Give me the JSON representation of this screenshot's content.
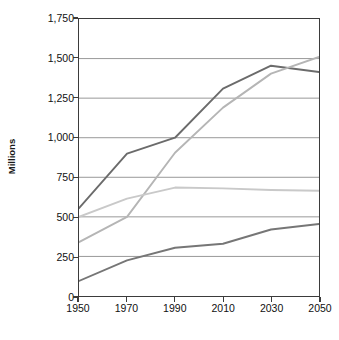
{
  "chart": {
    "title": "",
    "y_axis_title": "Millions",
    "x_axis_title": ""
  },
  "chart_data": {
    "type": "line",
    "title": "",
    "xlabel": "",
    "ylabel": "Millions",
    "x": [
      1950,
      1970,
      1990,
      2010,
      2030,
      2050
    ],
    "xtick_labels": [
      "1950",
      "1970",
      "1990",
      "2010",
      "2030",
      "2050"
    ],
    "ytick_labels": [
      "0",
      "250",
      "500",
      "750",
      "1,000",
      "1,250",
      "1,500",
      "1,750"
    ],
    "ytick_values": [
      0,
      250,
      500,
      750,
      1000,
      1250,
      1500,
      1750
    ],
    "xlim": [
      1950,
      2050
    ],
    "ylim": [
      0,
      1750
    ],
    "grid": "horizontal",
    "legend": "none",
    "series": [
      {
        "name": "series-1",
        "color": "#6b6b6b",
        "values": [
          555,
          900,
          1000,
          1310,
          1455,
          1415
        ]
      },
      {
        "name": "series-2",
        "color": "#b5b5b5",
        "values": [
          340,
          500,
          905,
          1190,
          1405,
          1510
        ]
      },
      {
        "name": "series-3",
        "color": "#c9c9c9",
        "values": [
          500,
          615,
          685,
          680,
          670,
          665
        ]
      },
      {
        "name": "series-4",
        "color": "#767676",
        "values": [
          95,
          225,
          305,
          330,
          420,
          455
        ]
      }
    ]
  }
}
